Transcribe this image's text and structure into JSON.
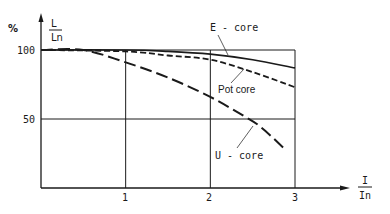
{
  "chart_data": {
    "type": "line",
    "title": "",
    "ylabel_unit": "%",
    "ylabel_num": "L",
    "ylabel_den": "Ln",
    "xlabel_num": "I",
    "xlabel_den": "In",
    "xlim": [
      0,
      3
    ],
    "ylim": [
      0,
      100
    ],
    "xticks": [
      1,
      2,
      3
    ],
    "xtick_labels": [
      "1",
      "2",
      "3"
    ],
    "yticks": [
      50,
      100
    ],
    "ytick_labels": [
      "50",
      "100"
    ],
    "grid": true,
    "series": [
      {
        "name": "E - core",
        "style": "solid",
        "x": [
          0,
          1,
          1.5,
          2,
          2.5,
          3
        ],
        "y": [
          100,
          100,
          99,
          97,
          93,
          87
        ]
      },
      {
        "name": "Pot core",
        "style": "dashed",
        "x": [
          0,
          1,
          1.5,
          2,
          2.5,
          3
        ],
        "y": [
          100,
          99,
          96,
          93,
          84,
          73
        ]
      },
      {
        "name": "U - core",
        "style": "long-dashed",
        "x": [
          0,
          0.5,
          1,
          1.5,
          2,
          2.4,
          2.6,
          2.9
        ],
        "y": [
          100,
          100,
          91,
          80,
          66,
          52,
          44,
          27
        ]
      }
    ],
    "annotations": [
      "E - core",
      "Pot core",
      "U - core"
    ]
  },
  "colors": {
    "ink": "#1a1a1a",
    "background": "#ffffff"
  }
}
